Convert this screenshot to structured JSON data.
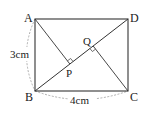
{
  "diagram": {
    "type": "geometry-rectangle",
    "points": {
      "A": {
        "label": "A",
        "x": 35,
        "y": 19
      },
      "D": {
        "label": "D",
        "x": 128,
        "y": 19
      },
      "B": {
        "label": "B",
        "x": 35,
        "y": 91
      },
      "C": {
        "label": "C",
        "x": 128,
        "y": 91
      },
      "P": {
        "label": "P",
        "x": 69.85,
        "y": 64.0
      },
      "Q": {
        "label": "Q",
        "x": 93.15,
        "y": 45.98
      }
    },
    "dimensions": {
      "AB": "3cm",
      "BC": "4cm"
    },
    "colors": {
      "line": "#333333",
      "dashed": "#999999"
    }
  }
}
